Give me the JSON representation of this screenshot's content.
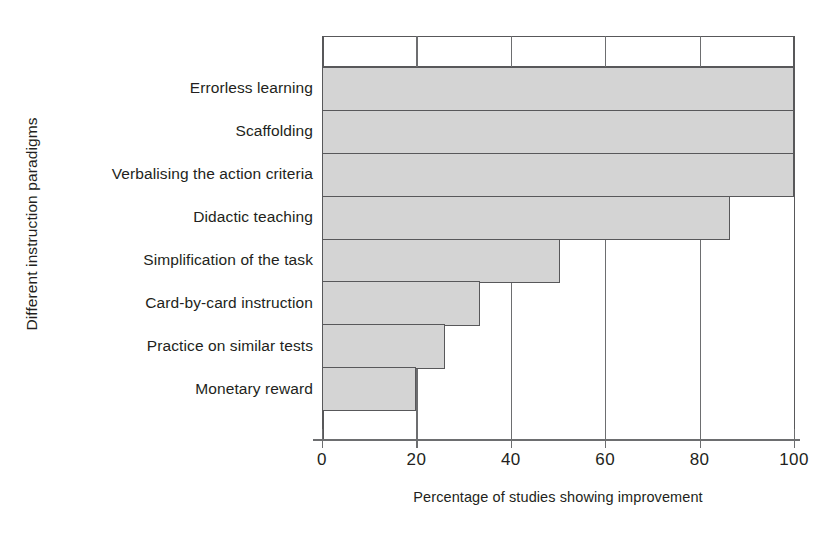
{
  "chart_data": {
    "type": "bar",
    "orientation": "horizontal",
    "title": "",
    "xlabel": "Percentage of studies showing improvement",
    "ylabel": "Different instruction paradigms",
    "categories": [
      "Errorless learning",
      "Scaffolding",
      "Verbalising the action criteria",
      "Didactic teaching",
      "Simplification of the task",
      "Card-by-card instruction",
      "Practice on similar tests",
      "Monetary reward"
    ],
    "values": [
      100,
      100,
      100,
      86.5,
      50.5,
      33.5,
      26,
      20
    ],
    "xlim": [
      0,
      100
    ],
    "xticks": [
      0,
      20,
      40,
      60,
      80,
      100
    ],
    "xtick_labels": [
      "0",
      "20",
      "40",
      "60",
      "80",
      "100"
    ],
    "grid": "vertical",
    "legend": "none",
    "bar_fill_color": "#d4d4d4",
    "bar_edge_color": "#58585a",
    "axis_color": "#6d6e70",
    "text_color": "#231f20",
    "background_color": "#ffffff"
  }
}
